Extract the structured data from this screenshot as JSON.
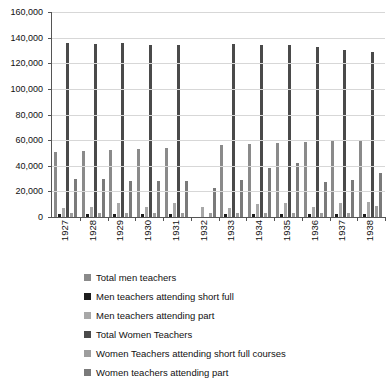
{
  "chart_data": {
    "type": "bar",
    "title": "",
    "xlabel": "",
    "ylabel": "",
    "ylim": [
      0,
      160000
    ],
    "ytick_step": 20000,
    "grid": true,
    "legend_position": "bottom",
    "categories": [
      "1927",
      "1928",
      "1929",
      "1930",
      "1931",
      "1932",
      "1933",
      "1934",
      "1935",
      "1936",
      "1937",
      "1938"
    ],
    "ytick_labels": [
      "160,000",
      "140,000",
      "120,000",
      "100,000",
      "80,000",
      "60,000",
      "40,000",
      "20,000",
      "0"
    ],
    "series": [
      {
        "name": "Total men teachers",
        "color": "#8a8a8a",
        "values": [
          51000,
          51500,
          52000,
          53000,
          54000,
          0,
          56000,
          57000,
          58000,
          58500,
          59500,
          60000
        ]
      },
      {
        "name": "Men teachers attending short full",
        "color": "#1d1d1d",
        "values": [
          2000,
          2000,
          2000,
          2000,
          2000,
          0,
          2200,
          2200,
          2200,
          2200,
          2200,
          2300
        ]
      },
      {
        "name": "Men teachers attending part",
        "color": "#a8a8a8",
        "values": [
          7000,
          7500,
          11000,
          8000,
          11000,
          8000,
          7000,
          10000,
          11000,
          8000,
          11000,
          12000
        ]
      },
      {
        "name": "Total Women Teachers",
        "color": "#4a4a4a",
        "values": [
          136000,
          135000,
          135500,
          134500,
          134000,
          0,
          135000,
          134500,
          134000,
          132500,
          130500,
          128500
        ]
      },
      {
        "name": "Women Teachers attending short full courses",
        "color": "#9d9d9d",
        "values": [
          3000,
          3000,
          3000,
          3000,
          3000,
          3500,
          3500,
          3500,
          3500,
          3500,
          3500,
          8500
        ]
      },
      {
        "name": "Women teachers attending part",
        "color": "#7a7a7a",
        "values": [
          30000,
          30000,
          28000,
          28000,
          28000,
          23000,
          29000,
          38000,
          42000,
          27000,
          29000,
          34000
        ]
      }
    ]
  }
}
